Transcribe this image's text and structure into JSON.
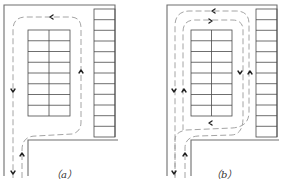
{
  "figure": {
    "type": "parking-lot-circulation-diagram",
    "panels": [
      {
        "id": "a",
        "caption": "（a）",
        "description": "single one-way loop around central parking block",
        "central_block": {
          "rows": 8,
          "cols": 2
        },
        "side_column": {
          "rows": 12
        },
        "arrows": [
          "left-top",
          "up-right-side",
          "down-left-side",
          "up-entry",
          "down-exit"
        ]
      },
      {
        "id": "b",
        "caption": "（b）",
        "description": "two-way double loop around central parking block",
        "central_block": {
          "rows": 8,
          "cols": 2
        },
        "side_column": {
          "rows": 12
        },
        "arrows": [
          "left-top-outer",
          "right-top-inner",
          "down-right-inner",
          "up-right-outer",
          "down-left-outer",
          "up-left-inner",
          "left-bottom",
          "up-entry",
          "down-exit"
        ]
      }
    ],
    "colors": {
      "wall": "#6e6e6e",
      "grid": "#4a4a4a",
      "path": "#9a9a9a",
      "arrow": "#222222"
    }
  }
}
